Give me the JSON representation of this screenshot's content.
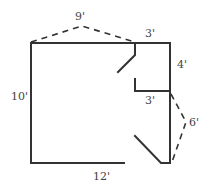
{
  "diagram": {
    "type": "floor-plan",
    "labels": {
      "top_dashed": "9'",
      "top_right": "3'",
      "left": "10'",
      "right_upper": "4'",
      "inner_ledge": "3'",
      "right_dashed": "6'",
      "bottom": "12'"
    },
    "colors": {
      "line": "#333333",
      "text": "#444444",
      "background": "#ffffff"
    }
  }
}
